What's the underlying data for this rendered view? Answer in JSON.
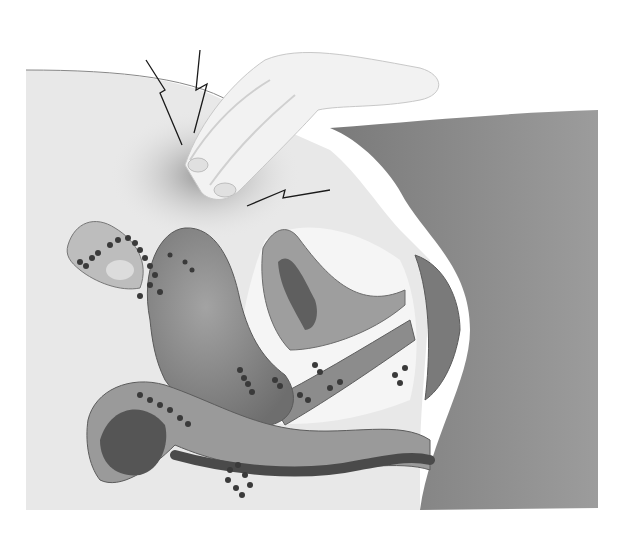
{
  "image": {
    "width": 623,
    "height": 533,
    "style": "grayscale medical illustration",
    "colors": {
      "background": "#ffffff",
      "skin_light": "#e6e6e6",
      "skin_shadow": "#9a9a9a",
      "body_side": "#8f8f8f",
      "organ": "#7d7d7d",
      "organ_dark": "#555555",
      "lesion": "#3a3a3a",
      "pain_mark": "#1a1a1a"
    }
  },
  "elements": {
    "hand": "hand pressing on lower abdomen",
    "pain_marks": [
      "lightning-bolt pain symbol left",
      "lightning-bolt pain symbol center",
      "lightning-bolt pain symbol right"
    ],
    "uterus": "uterus with endometrial lesions",
    "ovary": "ovary with lesions",
    "bladder": "bladder cross-section",
    "rectum": "rectum / bowel cross-section",
    "lesions": "scattered endometriosis implants"
  }
}
